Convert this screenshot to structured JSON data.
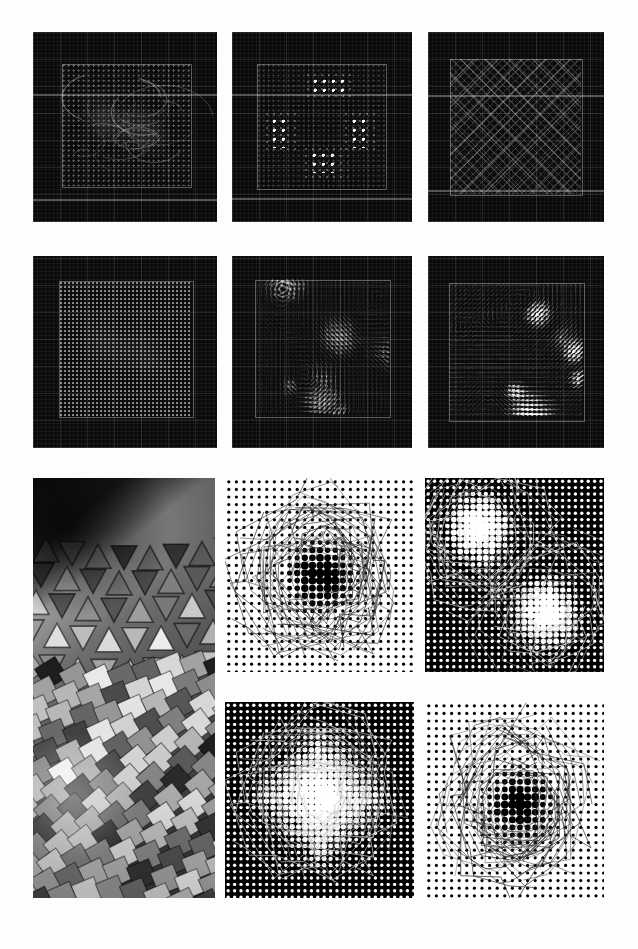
{
  "figure": {
    "background_color": "#fdfdfc",
    "width": 638,
    "height": 949,
    "columns": 3,
    "rows": 4,
    "caption": ""
  },
  "panels": [
    {
      "id": "r1c1",
      "label": "a",
      "kind": "dark-lattice-swirl",
      "description": "Dark square simulation frame with faint dotted lattice and swirling streak texture inside a thin inner rectangle",
      "x": 33,
      "y": 32,
      "w": 184,
      "h": 190,
      "background_color": "#090909",
      "accent_color": "#ffffff",
      "inner_box": {
        "x": 29,
        "y": 32,
        "w": 128,
        "h": 122
      },
      "band_rows": [
        62,
        167
      ],
      "brightness": "low"
    },
    {
      "id": "r1c2",
      "label": "b",
      "kind": "dark-lattice-clusters",
      "description": "Dark square frame with four bright dot clusters at top, bottom, left and right edges of the inner rectangle",
      "x": 232,
      "y": 32,
      "w": 180,
      "h": 190,
      "background_color": "#090909",
      "accent_color": "#ffffff",
      "inner_box": {
        "x": 25,
        "y": 32,
        "w": 128,
        "h": 124
      },
      "band_rows": [
        62,
        166
      ],
      "clusters": [
        {
          "x": 0.44,
          "y": 0.12,
          "w": 0.24,
          "h": 0.13
        },
        {
          "x": 0.12,
          "y": 0.44,
          "w": 0.13,
          "h": 0.24
        },
        {
          "x": 0.74,
          "y": 0.44,
          "w": 0.13,
          "h": 0.24
        },
        {
          "x": 0.43,
          "y": 0.72,
          "w": 0.22,
          "h": 0.16
        }
      ],
      "brightness": "low"
    },
    {
      "id": "r1c3",
      "label": "c",
      "kind": "dark-crosshatch",
      "description": "Dark square frame filled with a fine and coarse diagonal crosshatch (diamond) lattice",
      "x": 428,
      "y": 32,
      "w": 176,
      "h": 190,
      "background_color": "#090909",
      "accent_color": "#ffffff",
      "inner_box": {
        "x": 22,
        "y": 27,
        "w": 131,
        "h": 135
      },
      "band_rows": [
        63,
        158
      ],
      "brightness": "low"
    },
    {
      "id": "r2c1",
      "label": "d",
      "kind": "dark-dense-dots",
      "description": "Dark square frame with a dense regular dot lattice and faint local distortions",
      "x": 33,
      "y": 256,
      "w": 184,
      "h": 192,
      "background_color": "#0a0a0a",
      "accent_color": "#ffffff",
      "inner_box": {
        "x": 26,
        "y": 25,
        "w": 133,
        "h": 135
      },
      "brightness": "low"
    },
    {
      "id": "r2c2",
      "label": "e",
      "kind": "vector-field",
      "description": "Dark square frame with a grid of small arrow glyphs forming a swirling vector field, medium brightness",
      "x": 232,
      "y": 256,
      "w": 180,
      "h": 192,
      "background_color": "#0a0a0a",
      "accent_color": "#ffffff",
      "inner_box": {
        "x": 23,
        "y": 24,
        "w": 134,
        "h": 136
      },
      "arrow_intensity": 0.55,
      "brightness": "medium"
    },
    {
      "id": "r2c3",
      "label": "f",
      "kind": "vector-field",
      "description": "Dark square frame with a grid of bright arrow glyphs forming a strong swirling vector field with saturated white lobes",
      "x": 428,
      "y": 256,
      "w": 176,
      "h": 192,
      "background_color": "#0a0a0a",
      "accent_color": "#ffffff",
      "inner_box": {
        "x": 21,
        "y": 27,
        "w": 134,
        "h": 137
      },
      "arrow_intensity": 1.0,
      "brightness": "high"
    },
    {
      "id": "r3c1",
      "label": "g",
      "kind": "photograph",
      "description": "Greyscale photograph of a curved faceted metallic surface made of triangular and square tiles, spanning two rows",
      "x": 33,
      "y": 478,
      "w": 182,
      "h": 420,
      "background_color": "#6b6b6b",
      "brightness": "photographic"
    },
    {
      "id": "r3c2",
      "label": "h",
      "kind": "halftone-light",
      "description": "White background halftone with a regular grid of small black dots; central region shows enlarged dots and faint contour lines",
      "x": 225,
      "y": 478,
      "w": 189,
      "h": 194,
      "background_color": "#ffffff",
      "dot_color": "#000000",
      "polarity": "dark-dots-on-white",
      "defect_center": {
        "x": 0.5,
        "y": 0.5
      }
    },
    {
      "id": "r3c3",
      "label": "i",
      "kind": "halftone-dark",
      "description": "Black background halftone with a grid of white dots; two bright defect clusters with enlarged white dots at upper-left and lower-right",
      "x": 425,
      "y": 478,
      "w": 179,
      "h": 194,
      "background_color": "#000000",
      "dot_color": "#ffffff",
      "polarity": "light-dots-on-black",
      "defect_centers": [
        {
          "x": 0.3,
          "y": 0.26
        },
        {
          "x": 0.68,
          "y": 0.68
        }
      ]
    },
    {
      "id": "r4c2",
      "label": "j",
      "kind": "halftone-dark",
      "description": "Black background halftone with white dot grid and a large central diamond-shaped defect of strongly enlarged white dots",
      "x": 225,
      "y": 702,
      "w": 189,
      "h": 196,
      "background_color": "#000000",
      "dot_color": "#ffffff",
      "polarity": "light-dots-on-black",
      "defect_center": {
        "x": 0.5,
        "y": 0.48
      },
      "defect_shape": "diamond"
    },
    {
      "id": "r4c3",
      "label": "k",
      "kind": "halftone-light",
      "description": "White background halftone with black dot grid; an irregular central region shows much larger black dots bounded by fine contour lines",
      "x": 425,
      "y": 702,
      "w": 179,
      "h": 196,
      "background_color": "#ffffff",
      "dot_color": "#000000",
      "polarity": "dark-dots-on-white",
      "defect_center": {
        "x": 0.52,
        "y": 0.52
      }
    }
  ],
  "colors": {
    "page_background": "#fdfdfc",
    "panel_dark": "#090909",
    "panel_black": "#000000",
    "panel_white": "#ffffff",
    "accent": "#ffffff",
    "photo_mid": "#6b6b6b"
  }
}
